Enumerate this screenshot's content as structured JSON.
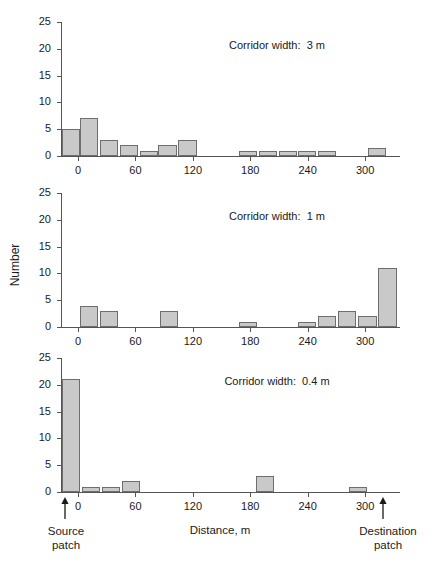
{
  "figure": {
    "y_axis_label": "Number",
    "x_axis_title": "Distance,  m",
    "source_label_line1": "Source",
    "source_label_line2": "patch",
    "destination_label_line1": "Destination",
    "destination_label_line2": "patch",
    "bar_fill": "#c9c9c9",
    "bar_stroke": "#6e6e6e",
    "axis_color": "#555555"
  },
  "chart_data": [
    {
      "type": "bar",
      "title": "Corridor width:  3 m",
      "panel_index": 1,
      "xlabel": "Distance,  m",
      "ylabel": "Number",
      "xlim": [
        -20,
        320
      ],
      "ylim": [
        0,
        25
      ],
      "yticks": [
        0,
        5,
        10,
        15,
        20,
        25
      ],
      "xticks": [
        0,
        60,
        120,
        180,
        240,
        300
      ],
      "grid": false,
      "bin_width": 19,
      "bins_start": [
        -17,
        2,
        23,
        44,
        65,
        84,
        105,
        168,
        189,
        210,
        230,
        251,
        303
      ],
      "values": [
        5,
        7,
        3,
        2,
        1,
        2,
        3,
        1,
        1,
        1,
        1,
        1,
        1.5
      ]
    },
    {
      "type": "bar",
      "title": "Corridor width:  1 m",
      "panel_index": 2,
      "xlabel": "Distance,  m",
      "ylabel": "Number",
      "xlim": [
        -20,
        320
      ],
      "ylim": [
        0,
        25
      ],
      "yticks": [
        0,
        5,
        10,
        15,
        20,
        25
      ],
      "xticks": [
        0,
        60,
        120,
        180,
        240,
        300
      ],
      "grid": false,
      "bin_width": 19,
      "bins_start": [
        2,
        23,
        86,
        168,
        230,
        251,
        272,
        293,
        314
      ],
      "values": [
        4,
        3,
        3,
        1,
        1,
        2,
        3,
        2,
        11
      ]
    },
    {
      "type": "bar",
      "title": "Corridor width:  0.4 m",
      "panel_index": 3,
      "xlabel": "Distance,  m",
      "ylabel": "Number",
      "xlim": [
        -20,
        320
      ],
      "ylim": [
        0,
        25
      ],
      "yticks": [
        0,
        5,
        10,
        15,
        20,
        25
      ],
      "xticks": [
        0,
        60,
        120,
        180,
        240,
        300
      ],
      "grid": false,
      "bin_width": 19,
      "bins_start": [
        -17,
        4,
        25,
        46,
        186,
        283
      ],
      "values": [
        21,
        1,
        1,
        2,
        3,
        1
      ]
    }
  ],
  "ytick_labels": [
    "0",
    "5",
    "10",
    "15",
    "20",
    "25"
  ],
  "xtick_labels": [
    "0",
    "60",
    "120",
    "180",
    "240",
    "300"
  ]
}
